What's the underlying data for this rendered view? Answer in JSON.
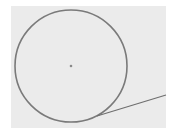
{
  "diagram": {
    "type": "circle-with-tangent-line",
    "background": {
      "x": 11,
      "y": 6,
      "width": 155,
      "height": 122,
      "color": "#ebebeb"
    },
    "circle": {
      "cx": 71,
      "cy": 66,
      "r": 56,
      "stroke": "#7a7a7a",
      "stroke_width": 1.6
    },
    "center_point": {
      "cx": 71,
      "cy": 66,
      "r": 1.3,
      "color": "#8a8a8a"
    },
    "tangent_line": {
      "x1": 97,
      "y1": 116,
      "x2": 166,
      "y2": 95,
      "stroke": "#6e6e6e",
      "stroke_width": 1.1
    }
  }
}
